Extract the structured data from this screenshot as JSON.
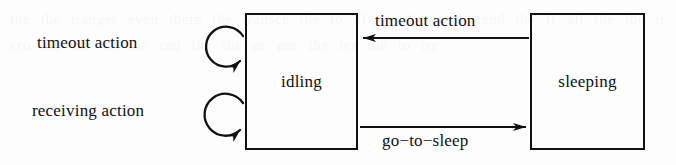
{
  "diagram": {
    "kind": "state-transition-diagram",
    "background_color": "#fdfdfd",
    "ink_color": "#111111",
    "states": [
      {
        "id": "idling",
        "label": "idling",
        "x": 245,
        "y": 13,
        "width": 113,
        "height": 137
      },
      {
        "id": "sleeping",
        "label": "sleeping",
        "x": 530,
        "y": 13,
        "width": 115,
        "height": 137
      }
    ],
    "self_loops": [
      {
        "id": "timeout-loop",
        "label": "timeout action",
        "target": "idling",
        "cx": 225,
        "cy": 48,
        "r": 20
      },
      {
        "id": "receiving-loop",
        "label": "receiving action",
        "target": "idling",
        "cx": 225,
        "cy": 116,
        "r": 21
      }
    ],
    "transitions": [
      {
        "id": "timeout-transition",
        "label": "timeout action",
        "from": "sleeping",
        "to": "idling",
        "direction": "left"
      },
      {
        "id": "go-to-sleep-transition",
        "label": "go−to−sleep",
        "from": "idling",
        "to": "sleeping",
        "direction": "right"
      }
    ],
    "bleed_through_text": "the the tranger even there the transce the to of the the it h tend the fr all the the tr cro the me on the ced the the pr por the ter the to tre"
  }
}
